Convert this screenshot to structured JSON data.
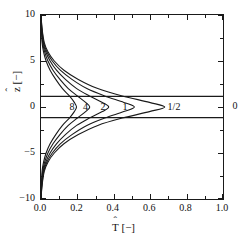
{
  "figure": {
    "background": "#ffffff",
    "axis_color": "#1a1a1a",
    "curve_color": "#1a1a1a"
  },
  "axes": {
    "x_title_base": "T",
    "x_title_units": " [−]",
    "y_title_base": "z",
    "y_title_units": " [−]",
    "hat": "ˆ",
    "x_ticklabels": [
      "0.0",
      "0.2",
      "0.4",
      "0.6",
      "0.8",
      "1.0"
    ],
    "x_tickvalues": [
      0.0,
      0.2,
      0.4,
      0.6,
      0.8,
      1.0
    ],
    "y_ticklabels": [
      "10",
      "5",
      "0",
      "−5",
      "−10"
    ],
    "y_tickvalues": [
      10,
      5,
      0,
      -5,
      -10
    ]
  },
  "annotations": {
    "label_8": "8",
    "label_4": "4",
    "label_2": "2",
    "label_1": "1",
    "label_half": "1/2",
    "label_zero": "0"
  },
  "chart_data": {
    "type": "line",
    "title": "",
    "xlabel": "T̂ [−]",
    "ylabel": "ẑ [−]",
    "xlim": [
      0.0,
      1.0
    ],
    "ylim": [
      -10,
      10
    ],
    "grid": false,
    "legend_position": "inline-curve-labels",
    "x_ticks": [
      0.0,
      0.2,
      0.4,
      0.6,
      0.8,
      1.0
    ],
    "y_ticks": [
      10,
      5,
      0,
      -5,
      -10
    ],
    "x_minor_ticks": [
      0.1,
      0.3,
      0.5,
      0.7,
      0.9
    ],
    "y_minor_ticks": [
      7.5,
      2.5,
      -2.5,
      -7.5
    ],
    "reference_lines": [
      {
        "name": "upper-boundary",
        "type": "horizontal",
        "y": 1.15,
        "x_from": 0.0,
        "x_to": 1.0
      },
      {
        "name": "lower-boundary",
        "type": "horizontal",
        "y": -1.15,
        "x_from": 0.0,
        "x_to": 1.0
      }
    ],
    "series": [
      {
        "name": "8",
        "label": "8",
        "peak_T": 0.195,
        "peak_z": 0.0,
        "label_position": {
          "T": 0.175,
          "z": 0.0
        },
        "x": [
          0.0,
          0.002,
          0.006,
          0.014,
          0.028,
          0.05,
          0.081,
          0.118,
          0.156,
          0.183,
          0.195,
          0.183,
          0.156,
          0.118,
          0.081,
          0.05,
          0.028,
          0.014,
          0.006,
          0.002,
          0.0
        ],
        "z": [
          10.0,
          8.5,
          7.0,
          6.0,
          5.0,
          4.0,
          3.0,
          2.0,
          1.2,
          0.5,
          0.0,
          -0.5,
          -1.2,
          -2.0,
          -3.0,
          -4.0,
          -5.0,
          -6.0,
          -7.0,
          -8.5,
          -10.0
        ]
      },
      {
        "name": "4",
        "label": "4",
        "peak_T": 0.268,
        "peak_z": 0.0,
        "label_position": {
          "T": 0.243,
          "z": 0.0
        },
        "x": [
          0.0,
          0.003,
          0.009,
          0.02,
          0.038,
          0.066,
          0.104,
          0.15,
          0.2,
          0.245,
          0.268,
          0.245,
          0.2,
          0.15,
          0.104,
          0.066,
          0.038,
          0.02,
          0.009,
          0.003,
          0.0
        ],
        "z": [
          10.0,
          8.5,
          7.0,
          6.0,
          5.0,
          4.0,
          3.0,
          2.0,
          1.2,
          0.5,
          0.0,
          -0.5,
          -1.2,
          -2.0,
          -3.0,
          -4.0,
          -5.0,
          -6.0,
          -7.0,
          -8.5,
          -10.0
        ]
      },
      {
        "name": "2",
        "label": "2",
        "peak_T": 0.372,
        "peak_z": 0.0,
        "label_position": {
          "T": 0.338,
          "z": 0.0
        },
        "x": [
          0.0,
          0.004,
          0.012,
          0.026,
          0.05,
          0.085,
          0.134,
          0.196,
          0.266,
          0.337,
          0.372,
          0.337,
          0.266,
          0.196,
          0.134,
          0.085,
          0.05,
          0.026,
          0.012,
          0.004,
          0.0
        ],
        "z": [
          10.0,
          8.5,
          7.0,
          6.0,
          5.0,
          4.0,
          3.0,
          2.0,
          1.2,
          0.5,
          0.0,
          -0.5,
          -1.2,
          -2.0,
          -3.0,
          -4.0,
          -5.0,
          -6.0,
          -7.0,
          -8.5,
          -10.0
        ]
      },
      {
        "name": "1",
        "label": "1",
        "peak_T": 0.513,
        "peak_z": 0.0,
        "label_position": {
          "T": 0.462,
          "z": 0.0
        },
        "x": [
          0.0,
          0.005,
          0.015,
          0.032,
          0.062,
          0.106,
          0.17,
          0.252,
          0.35,
          0.455,
          0.513,
          0.455,
          0.35,
          0.252,
          0.17,
          0.106,
          0.062,
          0.032,
          0.015,
          0.005,
          0.0
        ],
        "z": [
          10.0,
          8.5,
          7.0,
          6.0,
          5.0,
          4.0,
          3.0,
          2.0,
          1.2,
          0.5,
          0.0,
          -0.5,
          -1.2,
          -2.0,
          -3.0,
          -4.0,
          -5.0,
          -6.0,
          -7.0,
          -8.5,
          -10.0
        ]
      },
      {
        "name": "1/2",
        "label": "1/2",
        "peak_T": 0.68,
        "peak_z": 0.0,
        "label_position": {
          "T": 0.712,
          "z": 0.0
        },
        "x": [
          0.0,
          0.006,
          0.018,
          0.038,
          0.073,
          0.126,
          0.205,
          0.312,
          0.447,
          0.596,
          0.68,
          0.596,
          0.447,
          0.312,
          0.205,
          0.126,
          0.073,
          0.038,
          0.018,
          0.006,
          0.0
        ],
        "z": [
          10.0,
          8.5,
          7.0,
          6.0,
          5.0,
          4.0,
          3.0,
          2.0,
          1.2,
          0.5,
          0.0,
          -0.5,
          -1.2,
          -2.0,
          -3.0,
          -4.0,
          -5.0,
          -6.0,
          -7.0,
          -8.5,
          -10.0
        ]
      },
      {
        "name": "0",
        "label": "0",
        "peak_T": 1.0,
        "peak_z": 0.0,
        "label_position": {
          "T": 1.06,
          "z": 0.0
        },
        "note": "limiting case labelled outside the right frame"
      }
    ]
  }
}
